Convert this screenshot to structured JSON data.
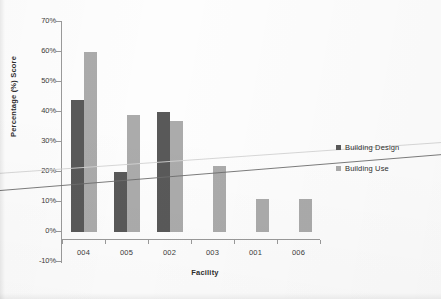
{
  "chart_data": {
    "type": "bar",
    "title": "",
    "xlabel": "Facility",
    "ylabel": "Percentage (%) Score",
    "categories": [
      "004",
      "005",
      "002",
      "003",
      "001",
      "006"
    ],
    "series": [
      {
        "name": "Building Design",
        "color": "#595959",
        "values": [
          44,
          20,
          40,
          0,
          0,
          0
        ]
      },
      {
        "name": "Building Use",
        "color": "#ababab",
        "values": [
          60,
          39,
          37,
          22,
          11,
          11
        ]
      }
    ],
    "ylim": [
      -10,
      70
    ],
    "ytick_labels": [
      "70%",
      "60%",
      "50%",
      "40%",
      "30%",
      "20%",
      "10%",
      "0%",
      "-10%"
    ],
    "ytick_values": [
      70,
      60,
      50,
      40,
      30,
      20,
      10,
      0,
      -10
    ],
    "grid": false,
    "legend_position": "right",
    "trendlines": [
      {
        "name": "building-design-trend",
        "color": "#6d6d6d",
        "start_value": 15.5,
        "end_value": 22.5
      },
      {
        "name": "building-use-trend",
        "color": "#d2d2d2",
        "start_value": 21.0,
        "end_value": 27.0
      }
    ]
  },
  "axis": {
    "x_title": "Facility",
    "y_title": "Percentage (%) Score"
  },
  "legend": {
    "items": [
      {
        "label": "Building Design",
        "color": "#595959"
      },
      {
        "label": "Building Use",
        "color": "#ababab"
      }
    ]
  }
}
